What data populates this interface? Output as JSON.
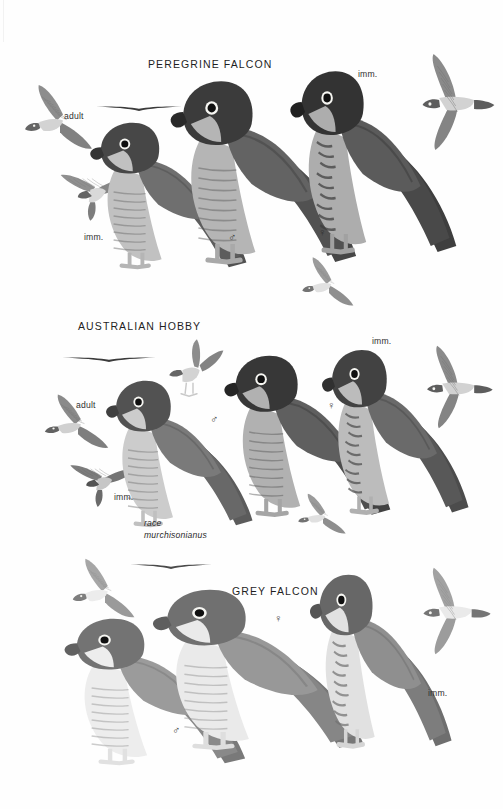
{
  "page": {
    "kind": "field-guide-plate",
    "background_color": "#fefefe",
    "ink_color": "#2b2b2b",
    "width": 503,
    "height": 809
  },
  "sections": [
    {
      "id": "peregrine",
      "title": "PEREGRINE FALCON",
      "title_pos": {
        "x": 148,
        "y": 58
      },
      "labels": [
        {
          "name": "adult",
          "text": "adult",
          "x": 64,
          "y": 111
        },
        {
          "name": "imm-left",
          "text": "imm.",
          "x": 84,
          "y": 232
        },
        {
          "name": "imm-right",
          "text": "imm.",
          "x": 358,
          "y": 69
        }
      ],
      "sex_marks": [
        {
          "name": "male",
          "glyph": "♂",
          "x": 228,
          "y": 231
        },
        {
          "name": "female",
          "glyph": "♀",
          "x": 318,
          "y": 226
        }
      ],
      "figures": [
        {
          "name": "adult-diving-upper",
          "type": "flight-diving",
          "x": 22,
          "y": 82,
          "w": 76,
          "h": 74,
          "tone": "#8d8d8d"
        },
        {
          "name": "adult-gliding-silhouette",
          "type": "silhouette-glide",
          "x": 96,
          "y": 104,
          "w": 86,
          "h": 10,
          "tone": "#3b3b3b"
        },
        {
          "name": "imm-flight-lower",
          "type": "flight-underside",
          "x": 56,
          "y": 160,
          "w": 78,
          "h": 62,
          "tone": "#8f8f8f"
        },
        {
          "name": "adult-male-perched",
          "type": "perched-left",
          "x": 88,
          "y": 112,
          "w": 160,
          "h": 160,
          "tone": "#6f6f6f"
        },
        {
          "name": "adult-female-perched",
          "type": "perched-left",
          "x": 168,
          "y": 68,
          "w": 190,
          "h": 200,
          "tone": "#636363"
        },
        {
          "name": "immature-perched",
          "type": "perched-left-streaked",
          "x": 288,
          "y": 58,
          "w": 170,
          "h": 200,
          "tone": "#5b5b5b"
        },
        {
          "name": "adult-flight-overhead",
          "type": "flight-overhead",
          "x": 406,
          "y": 52,
          "w": 92,
          "h": 100,
          "tone": "#8a8a8a"
        },
        {
          "name": "imm-flight-small",
          "type": "flight-diving",
          "x": 300,
          "y": 255,
          "w": 58,
          "h": 56,
          "tone": "#9b9b9b"
        }
      ]
    },
    {
      "id": "hobby",
      "title": "AUSTRALIAN HOBBY",
      "title_pos": {
        "x": 78,
        "y": 320
      },
      "labels": [
        {
          "name": "adult",
          "text": "adult",
          "x": 76,
          "y": 400
        },
        {
          "name": "imm-left",
          "text": "imm.",
          "x": 114,
          "y": 492
        },
        {
          "name": "imm-right",
          "text": "imm.",
          "x": 372,
          "y": 336
        },
        {
          "name": "race-line1",
          "text": "race",
          "x": 144,
          "y": 518
        },
        {
          "name": "race-line2",
          "text": "murchisonianus",
          "x": 144,
          "y": 530
        }
      ],
      "sex_marks": [
        {
          "name": "male",
          "glyph": "♂",
          "x": 210,
          "y": 413
        },
        {
          "name": "female",
          "glyph": "♀",
          "x": 327,
          "y": 399
        }
      ],
      "figures": [
        {
          "name": "adult-gliding-silhouette",
          "type": "silhouette-glide",
          "x": 62,
          "y": 355,
          "w": 94,
          "h": 10,
          "tone": "#3b3b3b"
        },
        {
          "name": "adult-flight-upper",
          "type": "flight-diving",
          "x": 42,
          "y": 392,
          "w": 72,
          "h": 62,
          "tone": "#8a8a8a"
        },
        {
          "name": "imm-flight-lower",
          "type": "flight-underside",
          "x": 66,
          "y": 452,
          "w": 72,
          "h": 56,
          "tone": "#7c7c7c"
        },
        {
          "name": "adult-male-perched",
          "type": "perched-left",
          "x": 104,
          "y": 370,
          "w": 150,
          "h": 160,
          "tone": "#7a7a7a"
        },
        {
          "name": "hobby-landing-flight",
          "type": "flight-landing",
          "x": 160,
          "y": 338,
          "w": 66,
          "h": 62,
          "tone": "#8d8d8d"
        },
        {
          "name": "adult-female-perched",
          "type": "perched-left",
          "x": 222,
          "y": 344,
          "w": 170,
          "h": 176,
          "tone": "#5f5f5f"
        },
        {
          "name": "immature-perched",
          "type": "perched-left-streaked",
          "x": 320,
          "y": 338,
          "w": 150,
          "h": 180,
          "tone": "#6a6a6a"
        },
        {
          "name": "adult-flight-overhead",
          "type": "flight-overhead",
          "x": 412,
          "y": 344,
          "w": 84,
          "h": 86,
          "tone": "#8a8a8a"
        },
        {
          "name": "imm-flight-small",
          "type": "flight-diving",
          "x": 296,
          "y": 492,
          "w": 54,
          "h": 46,
          "tone": "#9a9a9a"
        }
      ]
    },
    {
      "id": "grey",
      "title": "GREY FALCON",
      "title_pos": {
        "x": 232,
        "y": 585
      },
      "labels": [
        {
          "name": "imm-right",
          "text": "imm.",
          "x": 428,
          "y": 688
        }
      ],
      "sex_marks": [
        {
          "name": "male",
          "glyph": "♂",
          "x": 172,
          "y": 724
        },
        {
          "name": "female",
          "glyph": "♀",
          "x": 274,
          "y": 612
        }
      ],
      "figures": [
        {
          "name": "adult-gliding-silhouette",
          "type": "silhouette-glide",
          "x": 130,
          "y": 562,
          "w": 82,
          "h": 10,
          "tone": "#4a4a4a"
        },
        {
          "name": "adult-flight-upper",
          "type": "flight-diving",
          "x": 70,
          "y": 556,
          "w": 70,
          "h": 68,
          "tone": "#a6a6a6"
        },
        {
          "name": "adult-male-perched",
          "type": "perched-left",
          "x": 62,
          "y": 608,
          "w": 185,
          "h": 160,
          "tone": "#9b9b9b"
        },
        {
          "name": "adult-female-perched",
          "type": "perched-left",
          "x": 150,
          "y": 578,
          "w": 215,
          "h": 175,
          "tone": "#989898"
        },
        {
          "name": "immature-perched",
          "type": "perched-left-streaked",
          "x": 308,
          "y": 562,
          "w": 145,
          "h": 190,
          "tone": "#8f8f8f"
        },
        {
          "name": "adult-flight-overhead",
          "type": "flight-overhead",
          "x": 408,
          "y": 566,
          "w": 86,
          "h": 90,
          "tone": "#a2a2a2"
        }
      ]
    }
  ]
}
